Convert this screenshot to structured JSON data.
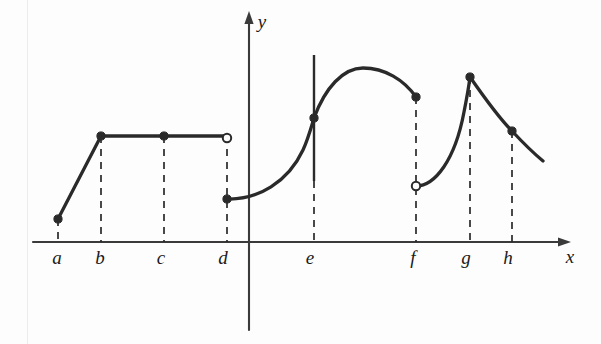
{
  "figure": {
    "background_color": "#fdfdfd",
    "ink_color": "#2a2a2a",
    "axis_color": "#3a3a3a"
  },
  "axes": {
    "x_axis": {
      "label": "x",
      "label_x": 570,
      "label_y": 263,
      "y_pixel": 242,
      "start_x": 33,
      "end_x": 568,
      "arrow": true
    },
    "y_axis": {
      "label": "y",
      "label_x": 262,
      "label_y": 28,
      "x_pixel": 249,
      "start_y": 330,
      "end_y": 14,
      "arrow": true
    }
  },
  "chart_data": {
    "type": "line",
    "xlabel": "x",
    "ylabel": "y",
    "grid": false,
    "legend": null,
    "tick_labels": [
      "a",
      "b",
      "c",
      "d",
      "e",
      "f",
      "g",
      "h"
    ],
    "tick_positions_px": [
      58,
      101,
      164,
      227,
      314,
      416,
      470,
      512
    ],
    "tick_label_positions_px": [
      57,
      100,
      161,
      223,
      310,
      413,
      466,
      508
    ],
    "axis_y_px": 242,
    "y_axis_x_px": 249,
    "segments": [
      {
        "name": "rising-segment-a-to-b",
        "kind": "line",
        "points": [
          [
            58,
            219
          ],
          [
            101,
            136
          ]
        ],
        "description": "straight line rising from a to b"
      },
      {
        "name": "plateau-segment-b-to-d",
        "kind": "line",
        "points": [
          [
            101,
            136
          ],
          [
            227,
            136
          ]
        ],
        "description": "horizontal constant segment from b to d"
      },
      {
        "name": "curve-d-to-e",
        "kind": "curve",
        "path": "M 227 199 C 258 200, 288 182, 303 150 C 308 139, 311 128, 314 118",
        "description": "flat then steeply rising from d to e"
      },
      {
        "name": "arch-e-to-f",
        "kind": "curve",
        "path": "M 314 118 C 325 88, 343 68, 363 68 C 385 68, 404 80, 416 97",
        "description": "smooth arch peaking between e and f"
      },
      {
        "name": "curve-f-to-g",
        "kind": "curve",
        "path": "M 416 186 C 435 186, 455 160, 464 112 C 467 97, 469 85, 470 77",
        "description": "rising from open circle at f up to peak at g"
      },
      {
        "name": "curve-g-to-end",
        "kind": "curve",
        "path": "M 470 77 C 486 100, 502 121, 512 131 C 525 145, 537 156, 543 161",
        "description": "descending from peak at g through h to right end"
      }
    ],
    "vertical_tangent": {
      "name": "vertical-tangent-at-e",
      "x": 314,
      "y_top": 55,
      "y_bottom": 181,
      "description": "solid vertical tangent line through the point at e"
    },
    "filled_points": [
      {
        "label": "a",
        "x": 58,
        "y": 219
      },
      {
        "label": "b",
        "x": 101,
        "y": 136
      },
      {
        "label": "c",
        "x": 164,
        "y": 136
      },
      {
        "label": "d",
        "x": 227,
        "y": 199
      },
      {
        "label": "e",
        "x": 314,
        "y": 118
      },
      {
        "label": "f",
        "x": 416,
        "y": 97
      },
      {
        "label": "g",
        "x": 470,
        "y": 77
      },
      {
        "label": "h",
        "x": 512,
        "y": 131
      }
    ],
    "open_points": [
      {
        "label": "d",
        "x": 227,
        "y": 138
      },
      {
        "label": "f",
        "x": 416,
        "y": 186
      }
    ],
    "dashed_droplines": [
      {
        "label": "b",
        "x": 101,
        "y_top": 136,
        "y_bottom": 242
      },
      {
        "label": "c",
        "x": 164,
        "y_top": 136,
        "y_bottom": 242
      },
      {
        "label": "d",
        "x": 227,
        "y_top": 136,
        "y_bottom": 242
      },
      {
        "label": "e",
        "x": 314,
        "y_top": 181,
        "y_bottom": 242
      },
      {
        "label": "f",
        "x": 416,
        "y_top": 97,
        "y_bottom": 242
      },
      {
        "label": "g",
        "x": 470,
        "y_top": 77,
        "y_bottom": 242
      },
      {
        "label": "h",
        "x": 512,
        "y_top": 131,
        "y_bottom": 242
      }
    ],
    "solid_droplines": [
      {
        "label": "a",
        "x": 58,
        "y_top": 219,
        "y_bottom": 242
      }
    ]
  }
}
